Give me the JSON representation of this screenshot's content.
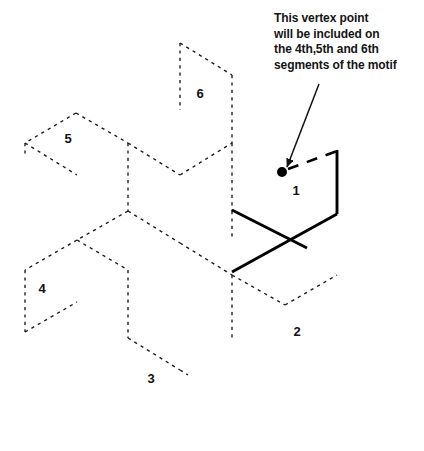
{
  "figure": {
    "kind": "geometric-diagram",
    "background_color": "#ffffff",
    "lattice_color": "#1a1a1a",
    "motif_color": "#000000",
    "annotation": {
      "lines": [
        "This vertex point",
        "will be included on",
        "the 4th,5th and 6th",
        "segments of the motif"
      ],
      "text_color": "#141414"
    },
    "cell_labels": [
      {
        "text": "1",
        "x": 296,
        "y": 192
      },
      {
        "text": "2",
        "x": 297,
        "y": 333
      },
      {
        "text": "3",
        "x": 151,
        "y": 380
      },
      {
        "text": "4",
        "x": 42,
        "y": 290
      },
      {
        "text": "5",
        "x": 68,
        "y": 140
      },
      {
        "text": "6",
        "x": 200,
        "y": 95
      }
    ],
    "vertex_point": {
      "name": "highlighted-vertex",
      "x": 282,
      "y": 172,
      "radius": 5
    },
    "arrow": {
      "from_x": 319,
      "from_y": 84,
      "to_x": 287,
      "to_y": 167
    },
    "dashed_motif_segment": {
      "from_x": 288,
      "from_y": 169,
      "to_x": 337,
      "to_y": 151
    },
    "solid_motif_path": "M 232 210 L 337 214 M 337 214 L 337 150 M 232 272 L 337 214",
    "solid_motif_segments": [
      {
        "x1": 232,
        "y1": 210,
        "x2": 307,
        "y2": 248
      },
      {
        "x1": 337,
        "y1": 214,
        "x2": 337,
        "y2": 150
      },
      {
        "x1": 232,
        "y1": 272,
        "x2": 337,
        "y2": 214
      }
    ],
    "lattice_paths": [
      "M 128 143 L 180 175",
      "M 180 175 L 232 143",
      "M 128 143 L 128 211",
      "M 232 143 L 232 211",
      "M 76 113 L 128 143",
      "M 76 113 L 25 143",
      "M 25 143 L 25 155",
      "M 25 143 L 77 175",
      "M 180 43 L 180 110",
      "M 180 43 L 232 75",
      "M 232 75 L 232 143",
      "M 128 211 L 77 240",
      "M 232 211 L 232 240",
      "M 128 211 L 180 243",
      "M 180 243 L 232 275",
      "M 77 240 L 25 270",
      "M 77 240 L 128 270",
      "M 25 270 L 25 332",
      "M 25 332 L 77 302",
      "M 128 270 L 128 338",
      "M 232 275 L 232 340",
      "M 232 275 L 285 305",
      "M 285 305 L 337 275",
      "M 128 338 L 180 370",
      "M 180 370 L 188 375"
    ]
  }
}
